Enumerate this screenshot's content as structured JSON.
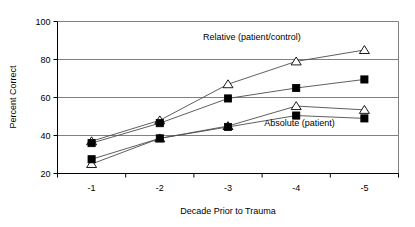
{
  "chart_data": {
    "type": "line",
    "title": "",
    "xlabel": "Decade Prior to Trauma",
    "ylabel": "Percent Correct",
    "categories": [
      "-1",
      "-2",
      "-3",
      "-4",
      "-5"
    ],
    "x": [
      1,
      2,
      3,
      4,
      5
    ],
    "xtick_labels": [
      "-1",
      "-2",
      "-3",
      "-4",
      "-5"
    ],
    "ytick_labels": [
      "20",
      "40",
      "60",
      "80",
      "100"
    ],
    "yticks": [
      20,
      40,
      60,
      80,
      100
    ],
    "ylim": [
      20,
      100
    ],
    "grid": "horizontal",
    "legend": "none",
    "series": [
      {
        "name": "Relative (patient/control) - open triangle",
        "marker": "open-triangle",
        "values": [
          37.0,
          48.0,
          67.0,
          79.0,
          85.0
        ]
      },
      {
        "name": "Relative (patient/control) - filled square",
        "marker": "filled-square",
        "values": [
          36.0,
          46.5,
          59.5,
          65.0,
          69.5
        ]
      },
      {
        "name": "Absolute (patient) - open triangle",
        "marker": "open-triangle",
        "values": [
          25.0,
          38.5,
          45.0,
          55.5,
          53.5
        ]
      },
      {
        "name": "Absolute (patient) - filled square",
        "marker": "filled-square",
        "values": [
          27.5,
          38.5,
          44.5,
          50.5,
          49.0
        ]
      }
    ],
    "annotations": [
      {
        "text": "Relative (patient/control)",
        "x": 3.35,
        "y": 90.5
      },
      {
        "text": "Absolute (patient)",
        "x": 4.05,
        "y": 45.0
      }
    ]
  },
  "axes": {
    "y_title": "Percent Correct",
    "x_title": "Decade Prior to Trauma"
  },
  "colors": {
    "line": "#4d4d4d",
    "grid": "#808080",
    "axis": "#000000",
    "marker_fill": "#000000",
    "background": "#ffffff"
  }
}
